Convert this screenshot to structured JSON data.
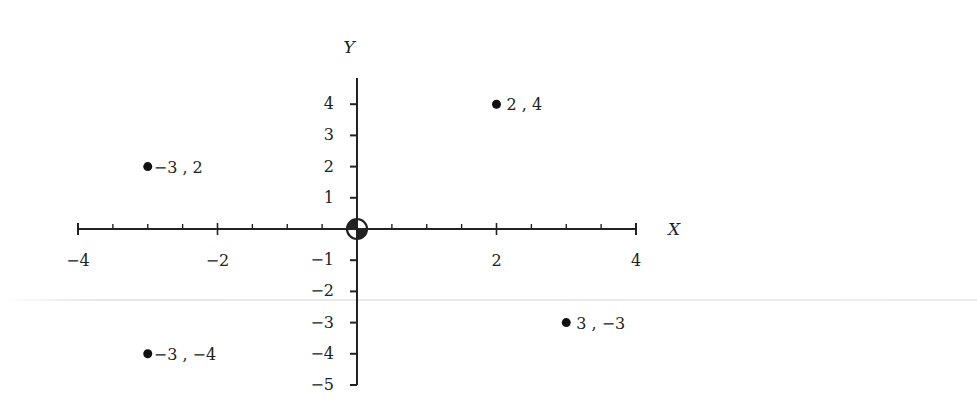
{
  "chart_data": {
    "type": "scatter",
    "title": "",
    "xlabel": "X",
    "ylabel": "Y",
    "xlim": [
      -4,
      4
    ],
    "ylim": [
      -5,
      4.8
    ],
    "grid": false,
    "legend": null,
    "x_ticks": [
      -4,
      -2,
      2,
      4
    ],
    "x_tick_labels": [
      "−4",
      "−2",
      "2",
      "4"
    ],
    "x_minor_step": 0.5,
    "y_ticks": [
      4,
      3,
      2,
      1,
      -1,
      -2,
      -3,
      -4,
      -5
    ],
    "y_tick_labels": [
      "4",
      "3",
      "2",
      "1",
      "−1",
      "−2",
      "−3",
      "−4",
      "−5"
    ],
    "origin_marker": "circle-quadrant",
    "points": [
      {
        "x": 2,
        "y": 4,
        "label": "2 , 4"
      },
      {
        "x": -3,
        "y": 2,
        "label": "−3 , 2"
      },
      {
        "x": 3,
        "y": -3,
        "label": "3 , −3"
      },
      {
        "x": -3,
        "y": -4,
        "label": "−3 , −4"
      }
    ]
  },
  "layout": {
    "origin_px": [
      357,
      229
    ],
    "x_scale": 69.75,
    "y_scale": 31.2,
    "axis_color": "#222222",
    "point_color": "#111111"
  }
}
